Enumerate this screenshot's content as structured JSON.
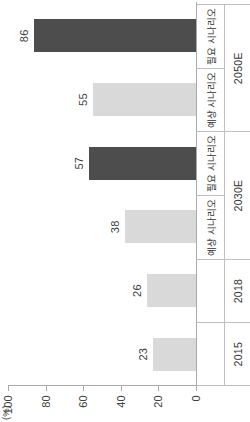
{
  "chart": {
    "unit_label": "(%)",
    "axis": {
      "ticks": [
        "0",
        "20",
        "40",
        "60",
        "80",
        "100"
      ],
      "min": 0,
      "max": 100
    },
    "scenario_row": [
      {
        "label": "",
        "span": 1
      },
      {
        "label": "",
        "span": 1
      },
      {
        "label": "예상 시나리오",
        "span": 1
      },
      {
        "label": "필요 시나리오",
        "span": 1
      },
      {
        "label": "예상 시나리오",
        "span": 1
      },
      {
        "label": "필요 시나리오",
        "span": 1
      }
    ],
    "year_row": [
      {
        "label": "2015",
        "span": 1
      },
      {
        "label": "2018",
        "span": 1
      },
      {
        "label": "2030E",
        "span": 2
      },
      {
        "label": "2050E",
        "span": 2
      }
    ],
    "bars": [
      {
        "value": 23,
        "label": "23",
        "color": "#d9d9d9"
      },
      {
        "value": 26,
        "label": "26",
        "color": "#d9d9d9"
      },
      {
        "value": 38,
        "label": "38",
        "color": "#d9d9d9"
      },
      {
        "value": 57,
        "label": "57",
        "color": "#4d4d4d"
      },
      {
        "value": 55,
        "label": "55",
        "color": "#d9d9d9"
      },
      {
        "value": 86,
        "label": "86",
        "color": "#4d4d4d"
      }
    ]
  },
  "chart_data": {
    "type": "bar",
    "title": "",
    "subtitle": "",
    "xlabel": "",
    "ylabel": "(%)",
    "ylim": [
      0,
      100
    ],
    "yticks": [
      0,
      20,
      40,
      60,
      80,
      100
    ],
    "grid": false,
    "legend": [],
    "orientation": "vertical-bars-rendered-rotated-90ccw",
    "categories": [
      "2015",
      "2018",
      "2030E 예상 시나리오",
      "2030E 필요 시나리오",
      "2050E 예상 시나리오",
      "2050E 필요 시나리오"
    ],
    "category_years": [
      "2015",
      "2018",
      "2030E",
      "2030E",
      "2050E",
      "2050E"
    ],
    "category_scenarios": [
      "",
      "",
      "예상 시나리오",
      "필요 시나리오",
      "예상 시나리오",
      "필요 시나리오"
    ],
    "values": [
      23,
      26,
      38,
      57,
      55,
      86
    ],
    "data_labels": [
      "23",
      "26",
      "38",
      "57",
      "55",
      "86"
    ],
    "bar_colors": [
      "#d9d9d9",
      "#d9d9d9",
      "#d9d9d9",
      "#4d4d4d",
      "#d9d9d9",
      "#4d4d4d"
    ],
    "series": [
      {
        "name": "비중",
        "values": [
          23,
          26,
          38,
          57,
          55,
          86
        ]
      }
    ]
  }
}
